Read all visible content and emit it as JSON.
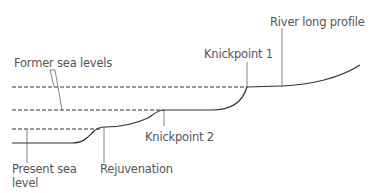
{
  "diagram": {
    "labels": {
      "river_long_profile": "River long profile",
      "knickpoint_1": "Knickpoint 1",
      "former_sea_levels": "Former sea levels",
      "knickpoint_2": "Knickpoint 2",
      "present_sea_level_line1": "Present sea",
      "present_sea_level_line2": "level",
      "rejuvenation": "Rejuvenation"
    },
    "colors": {
      "line": "#333333",
      "leader": "#666666",
      "text": "#555555"
    }
  }
}
